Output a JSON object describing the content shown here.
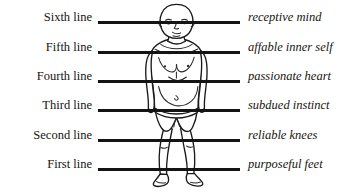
{
  "diagram": {
    "figure": {
      "name": "standing-human-figure",
      "description": "front-facing line drawing of a standing person wearing a loincloth"
    },
    "rows": [
      {
        "left_label": "Sixth line",
        "right_label": "receptive mind",
        "y": 22
      },
      {
        "left_label": "Fifth line",
        "right_label": "affable inner self",
        "y": 52
      },
      {
        "left_label": "Fourth line",
        "right_label": "passionate heart",
        "y": 81
      },
      {
        "left_label": "Third line",
        "right_label": "subdued instinct",
        "y": 110
      },
      {
        "left_label": "Second line",
        "right_label": "reliable knees",
        "y": 140
      },
      {
        "left_label": "First line",
        "right_label": "purposeful feet",
        "y": 169
      }
    ],
    "colors": {
      "background": "#ffffff",
      "rule": "#141414",
      "text": "#16140f",
      "figure_outline": "#1a1a1a"
    }
  }
}
